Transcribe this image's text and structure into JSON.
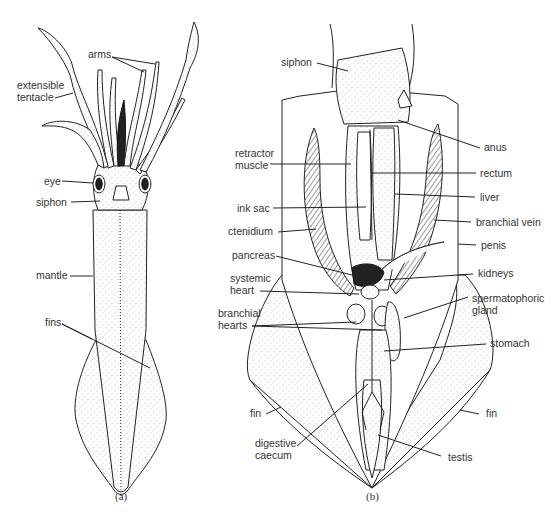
{
  "figure": {
    "panels": [
      {
        "id": "a",
        "caption": "(a)",
        "labels": [
          {
            "text": "arms",
            "x": 88,
            "y": 58
          },
          {
            "text": "extensible",
            "x": 17,
            "y": 89
          },
          {
            "text": "tentacle",
            "x": 17,
            "y": 101
          },
          {
            "text": "eye",
            "x": 44,
            "y": 185
          },
          {
            "text": "siphon",
            "x": 36,
            "y": 206
          },
          {
            "text": "mantle",
            "x": 36,
            "y": 279
          },
          {
            "text": "fins",
            "x": 45,
            "y": 326
          }
        ]
      },
      {
        "id": "b",
        "caption": "(b)",
        "labels": [
          {
            "text": "siphon",
            "x": 281,
            "y": 66
          },
          {
            "text": "retractor",
            "x": 235,
            "y": 157
          },
          {
            "text": "muscle",
            "x": 235,
            "y": 169
          },
          {
            "text": "ink sac",
            "x": 237,
            "y": 212
          },
          {
            "text": "ctenidium",
            "x": 228,
            "y": 235
          },
          {
            "text": "pancreas",
            "x": 232,
            "y": 259
          },
          {
            "text": "systemic",
            "x": 230,
            "y": 282
          },
          {
            "text": "heart",
            "x": 230,
            "y": 294
          },
          {
            "text": "branchial",
            "x": 218,
            "y": 317
          },
          {
            "text": "hearts",
            "x": 218,
            "y": 329
          },
          {
            "text": "fin",
            "x": 250,
            "y": 417
          },
          {
            "text": "digestive",
            "x": 255,
            "y": 447
          },
          {
            "text": "caecum",
            "x": 255,
            "y": 459
          },
          {
            "text": "anus",
            "x": 484,
            "y": 151
          },
          {
            "text": "rectum",
            "x": 480,
            "y": 177
          },
          {
            "text": "liver",
            "x": 480,
            "y": 201
          },
          {
            "text": "branchial vein",
            "x": 476,
            "y": 226
          },
          {
            "text": "penis",
            "x": 481,
            "y": 249
          },
          {
            "text": "kidneys",
            "x": 478,
            "y": 277
          },
          {
            "text": "spermatophoric",
            "x": 472,
            "y": 302
          },
          {
            "text": "gland",
            "x": 472,
            "y": 314
          },
          {
            "text": "stomach",
            "x": 490,
            "y": 347
          },
          {
            "text": "fin",
            "x": 486,
            "y": 417
          },
          {
            "text": "testis",
            "x": 448,
            "y": 461
          }
        ]
      }
    ]
  },
  "colors": {
    "line": "#222222",
    "label": "#333333",
    "background": "#ffffff"
  }
}
